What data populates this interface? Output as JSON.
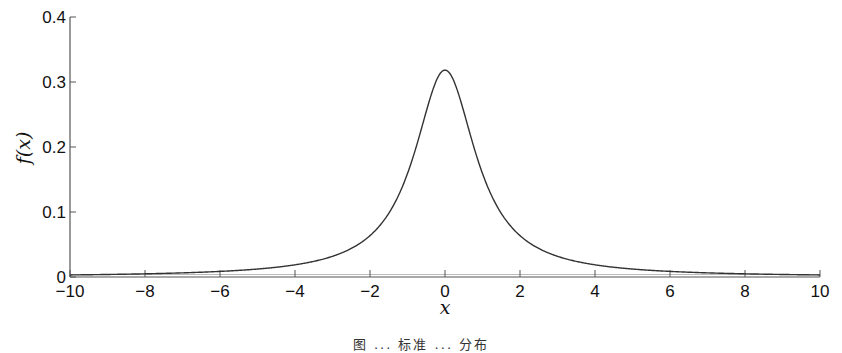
{
  "chart_data": {
    "type": "line",
    "title": "",
    "xlabel": "x",
    "ylabel": "f(x)",
    "xlim": [
      -10,
      10
    ],
    "ylim": [
      0,
      0.4
    ],
    "grid": false,
    "legend": null,
    "x_ticks": [
      "-10",
      "-8",
      "-6",
      "-4",
      "-2",
      "0",
      "2",
      "4",
      "6",
      "8",
      "10"
    ],
    "y_ticks": [
      "0",
      "0.1",
      "0.2",
      "0.3",
      "0.4"
    ],
    "series": [
      {
        "name": "Cauchy density f(x) = 1/(π(1+x²))",
        "x": [
          -10,
          -8,
          -6,
          -4,
          -3,
          -2,
          -1.5,
          -1,
          -0.5,
          0,
          0.5,
          1,
          1.5,
          2,
          3,
          4,
          6,
          8,
          10
        ],
        "y": [
          0.0032,
          0.0049,
          0.0086,
          0.0187,
          0.0318,
          0.0637,
          0.0979,
          0.1592,
          0.2546,
          0.3183,
          0.2546,
          0.1592,
          0.0979,
          0.0637,
          0.0318,
          0.0187,
          0.0086,
          0.0049,
          0.0032
        ]
      }
    ],
    "caption": "图 ... 标准 ... 分布"
  }
}
